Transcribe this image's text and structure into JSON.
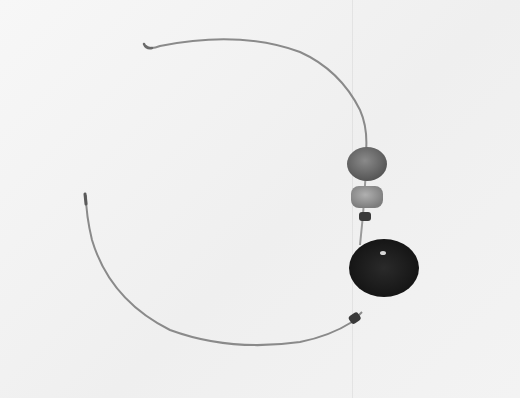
{
  "image": {
    "subject": "wire necklace with beads",
    "background_color": "#f4f4f4",
    "wire_color": "#8a8a8a",
    "beads": [
      {
        "name": "large round bead",
        "color": "#6e6e6e"
      },
      {
        "name": "barrel bead",
        "color": "#9a9a9a"
      },
      {
        "name": "small spacer bead upper",
        "color": "#3a3a3a"
      },
      {
        "name": "large flat disc bead",
        "color": "#1c1c1c"
      },
      {
        "name": "small spacer bead lower",
        "color": "#3a3a3a"
      }
    ]
  }
}
